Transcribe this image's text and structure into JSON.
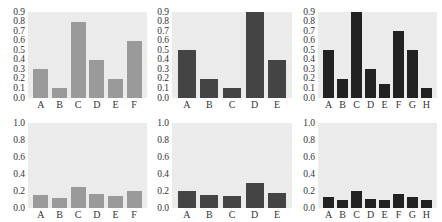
{
  "chart_data": [
    {
      "type": "bar",
      "panel": "top-left",
      "categories": [
        "A",
        "B",
        "C",
        "D",
        "E",
        "F"
      ],
      "values": [
        0.3,
        0.1,
        0.8,
        0.4,
        0.2,
        0.6
      ],
      "ylim": [
        0,
        0.9
      ],
      "yticks": [
        "0.0",
        "0.1",
        "0.2",
        "0.3",
        "0.4",
        "0.5",
        "0.6",
        "0.7",
        "0.8",
        "0.9"
      ],
      "color": "#9a9a9a",
      "title": "",
      "xlabel": "",
      "ylabel": "",
      "grid": false
    },
    {
      "type": "bar",
      "panel": "top-middle",
      "categories": [
        "A",
        "B",
        "C",
        "D",
        "E"
      ],
      "values": [
        0.5,
        0.2,
        0.1,
        0.9,
        0.4
      ],
      "ylim": [
        0,
        0.9
      ],
      "yticks": [
        "0.0",
        "0.1",
        "0.2",
        "0.3",
        "0.4",
        "0.5",
        "0.6",
        "0.7",
        "0.8",
        "0.9"
      ],
      "color": "#444444",
      "title": "",
      "xlabel": "",
      "ylabel": "",
      "grid": false
    },
    {
      "type": "bar",
      "panel": "top-right",
      "categories": [
        "A",
        "B",
        "C",
        "D",
        "E",
        "F",
        "G",
        "H"
      ],
      "values": [
        0.5,
        0.2,
        0.9,
        0.3,
        0.15,
        0.7,
        0.5,
        0.1
      ],
      "ylim": [
        0,
        0.9
      ],
      "yticks": [
        "0.0",
        "0.1",
        "0.2",
        "0.3",
        "0.4",
        "0.5",
        "0.6",
        "0.7",
        "0.8",
        "0.9"
      ],
      "color": "#222222",
      "title": "",
      "xlabel": "",
      "ylabel": "",
      "grid": false
    },
    {
      "type": "bar",
      "panel": "bottom-left",
      "categories": [
        "A",
        "B",
        "C",
        "D",
        "E",
        "F"
      ],
      "values": [
        0.15,
        0.12,
        0.25,
        0.17,
        0.14,
        0.2
      ],
      "ylim": [
        0,
        1.0
      ],
      "yticks": [
        "0.0",
        "0.2",
        "0.4",
        "0.6",
        "0.8",
        "1.0"
      ],
      "color": "#9a9a9a",
      "title": "",
      "xlabel": "",
      "ylabel": "",
      "grid": false
    },
    {
      "type": "bar",
      "panel": "bottom-middle",
      "categories": [
        "A",
        "B",
        "C",
        "D",
        "E"
      ],
      "values": [
        0.2,
        0.15,
        0.14,
        0.3,
        0.18
      ],
      "ylim": [
        0,
        1.0
      ],
      "yticks": [
        "0.0",
        "0.2",
        "0.4",
        "0.6",
        "0.8",
        "1.0"
      ],
      "color": "#444444",
      "title": "",
      "xlabel": "",
      "ylabel": "",
      "grid": false
    },
    {
      "type": "bar",
      "panel": "bottom-right",
      "categories": [
        "A",
        "B",
        "C",
        "D",
        "E",
        "F",
        "G",
        "H"
      ],
      "values": [
        0.13,
        0.1,
        0.2,
        0.11,
        0.09,
        0.17,
        0.13,
        0.09
      ],
      "ylim": [
        0,
        1.0
      ],
      "yticks": [
        "0.0",
        "0.2",
        "0.4",
        "0.6",
        "0.8",
        "1.0"
      ],
      "color": "#222222",
      "title": "",
      "xlabel": "",
      "ylabel": "",
      "grid": false
    }
  ]
}
